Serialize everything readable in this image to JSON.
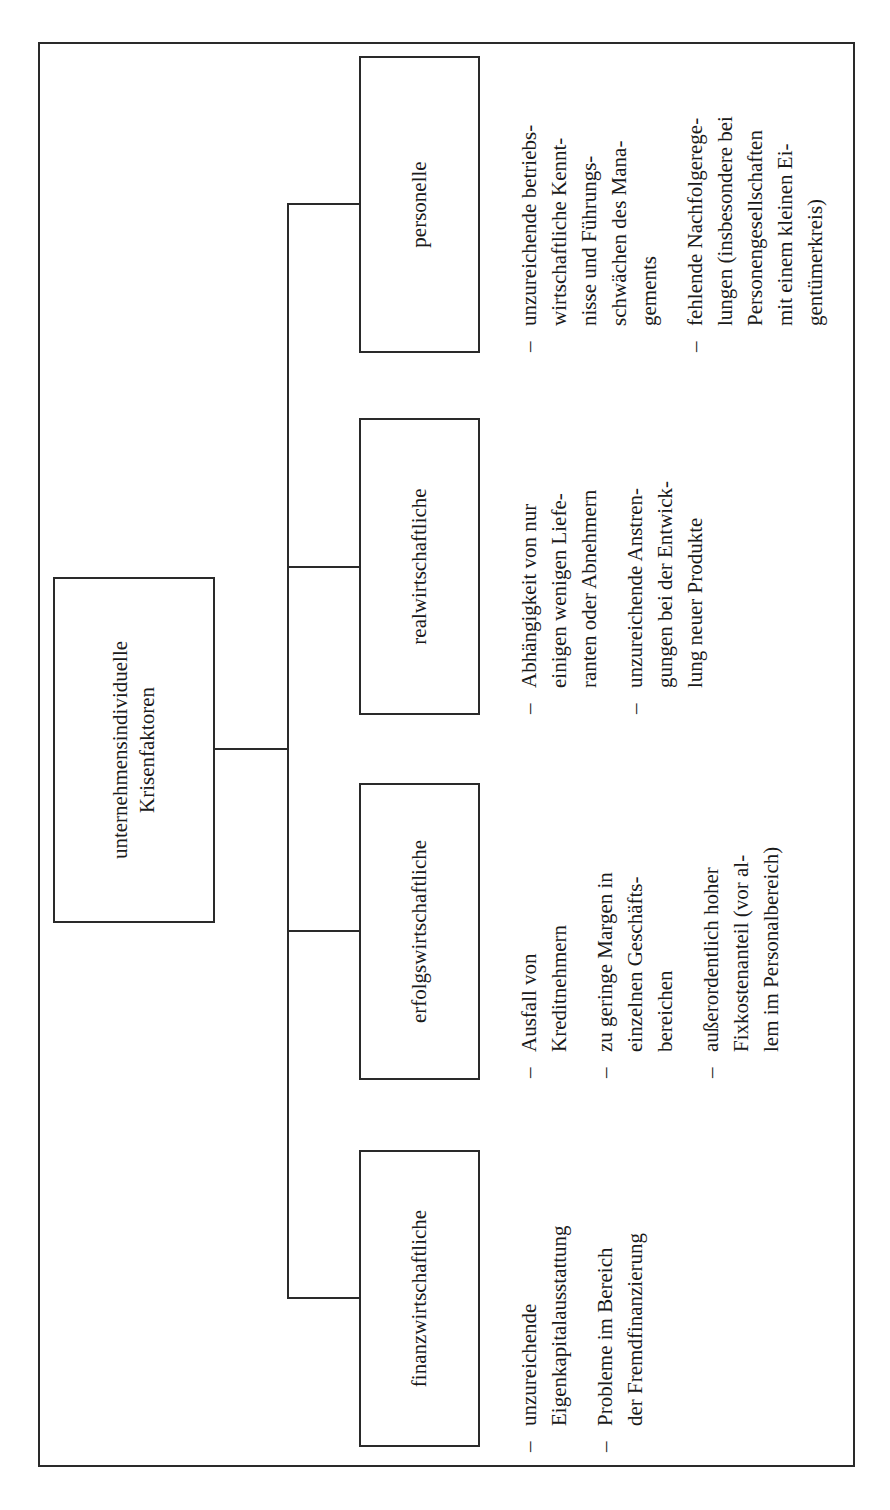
{
  "diagram": {
    "root": {
      "line1": "unternehmensindividuelle",
      "line2": "Krisenfaktoren"
    },
    "categories": [
      {
        "label": "finanzwirtschaftliche",
        "items": [
          "unzureichende\nEigenkapitalausstattung",
          "Probleme im Bereich\nder Fremdfinanzierung"
        ]
      },
      {
        "label": "erfolgswirtschaftliche",
        "items": [
          "Ausfall von\nKreditnehmern",
          "zu geringe Margen in\neinzelnen Geschäfts-\nbereichen",
          "außerordentlich hoher\nFixkostenanteil (vor al-\nlem im Personalbereich)"
        ]
      },
      {
        "label": "realwirtschaftliche",
        "items": [
          "Abhängigkeit von nur\neinigen wenigen Liefe-\nranten oder Abnehmern",
          "unzureichende Anstren-\ngungen bei der Entwick-\nlung neuer Produkte"
        ]
      },
      {
        "label": "personelle",
        "items": [
          "unzureichende betriebs-\nwirtschaftliche Kennt-\nnisse und Führungs-\nschwächen des Mana-\ngements",
          "fehlende Nachfolgerege-\nlungen (insbesondere bei\nPersonengesellschaften\nmit einem kleinen Ei-\ngentümerkreis)"
        ]
      }
    ],
    "bullet_glyph": "–",
    "orientation": "rotated 90° counter-clockwise"
  }
}
